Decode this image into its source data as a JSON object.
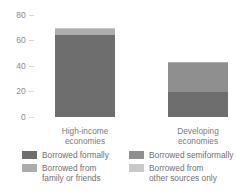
{
  "chart_data": {
    "type": "bar",
    "stacked": true,
    "title": "",
    "xlabel": "",
    "ylabel": "",
    "ylim": [
      0,
      80
    ],
    "yticks": [
      0,
      20,
      40,
      60,
      80
    ],
    "grid": false,
    "legend_position": "bottom",
    "categories": [
      "High-income economies",
      "Developing economies"
    ],
    "series": [
      {
        "name": "Borrowed formally",
        "color": "#6e6e6e",
        "values": [
          64,
          20
        ]
      },
      {
        "name": "Borrowed semiformally",
        "color": "#8f8f8f",
        "values": [
          0,
          22
        ]
      },
      {
        "name": "Borrowed from family or friends",
        "color": "#adadad",
        "values": [
          5,
          1
        ]
      },
      {
        "name": "Borrowed from other sources only",
        "color": "#c9c9c9",
        "values": [
          1,
          0
        ]
      }
    ],
    "totals": [
      70,
      43
    ]
  },
  "axis": {
    "yticks": [
      "80",
      "60",
      "40",
      "20",
      "0"
    ]
  },
  "categories": [
    {
      "line1": "High-income",
      "line2": "economies"
    },
    {
      "line1": "Developing",
      "line2": "economies"
    }
  ],
  "legend": [
    {
      "line1": "Borrowed formally",
      "line2": ""
    },
    {
      "line1": "Borrowed semiformally",
      "line2": ""
    },
    {
      "line1": "Borrowed from",
      "line2": "family or friends"
    },
    {
      "line1": "Borrowed from",
      "line2": "other sources only"
    }
  ]
}
